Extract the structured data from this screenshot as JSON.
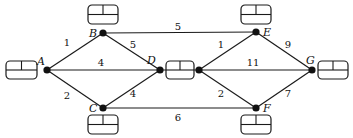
{
  "diagram": {
    "type": "weighted-network",
    "colors": {
      "stroke": "#1a1a1a",
      "node": "#111111",
      "background": "#ffffff"
    },
    "nodes": [
      {
        "id": "A",
        "label": "A",
        "x": 47,
        "y": 70,
        "lx": 37,
        "ly": 65,
        "box": {
          "x": 6,
          "y": 61,
          "w": 31,
          "h": 18
        }
      },
      {
        "id": "B",
        "label": "B",
        "x": 103,
        "y": 33,
        "lx": 89,
        "ly": 37,
        "box": {
          "x": 88,
          "y": 5,
          "w": 30,
          "h": 19
        }
      },
      {
        "id": "C",
        "label": "C",
        "x": 103,
        "y": 108,
        "lx": 89,
        "ly": 112,
        "box": {
          "x": 88,
          "y": 115,
          "w": 30,
          "h": 19
        }
      },
      {
        "id": "D",
        "label": "D",
        "x": 160,
        "y": 70,
        "lx": 147,
        "ly": 64,
        "box": {
          "x": 166,
          "y": 61,
          "w": 28,
          "h": 18
        }
      },
      {
        "id": "D2",
        "label": "",
        "x": 199,
        "y": 70,
        "lx": 0,
        "ly": 0,
        "box": null
      },
      {
        "id": "E",
        "label": "E",
        "x": 256,
        "y": 32,
        "lx": 263,
        "ly": 36,
        "box": {
          "x": 241,
          "y": 5,
          "w": 30,
          "h": 19
        }
      },
      {
        "id": "F",
        "label": "F",
        "x": 256,
        "y": 108,
        "lx": 263,
        "ly": 112,
        "box": {
          "x": 241,
          "y": 115,
          "w": 30,
          "h": 19
        }
      },
      {
        "id": "G",
        "label": "G",
        "x": 312,
        "y": 70,
        "lx": 306,
        "ly": 64,
        "box": {
          "x": 318,
          "y": 61,
          "w": 30,
          "h": 18
        }
      }
    ],
    "edges": [
      {
        "from": "A",
        "to": "B",
        "weight": "1",
        "wx": 67,
        "wy": 46
      },
      {
        "from": "A",
        "to": "D",
        "weight": "4",
        "wx": 101,
        "wy": 66
      },
      {
        "from": "A",
        "to": "C",
        "weight": "2",
        "wx": 67,
        "wy": 99
      },
      {
        "from": "B",
        "to": "D",
        "weight": "5",
        "wx": 133,
        "wy": 48
      },
      {
        "from": "C",
        "to": "D",
        "weight": "4",
        "wx": 133,
        "wy": 97
      },
      {
        "from": "B",
        "to": "E",
        "weight": "5",
        "wx": 178,
        "wy": 30
      },
      {
        "from": "C",
        "to": "F",
        "weight": "6",
        "wx": 178,
        "wy": 121
      },
      {
        "from": "D2",
        "to": "E",
        "weight": "1",
        "wx": 221,
        "wy": 48
      },
      {
        "from": "D2",
        "to": "G",
        "weight": "11",
        "wx": 253,
        "wy": 66
      },
      {
        "from": "D2",
        "to": "F",
        "weight": "2",
        "wx": 221,
        "wy": 97
      },
      {
        "from": "E",
        "to": "G",
        "weight": "9",
        "wx": 288,
        "wy": 48
      },
      {
        "from": "F",
        "to": "G",
        "weight": "7",
        "wx": 288,
        "wy": 97
      }
    ]
  }
}
